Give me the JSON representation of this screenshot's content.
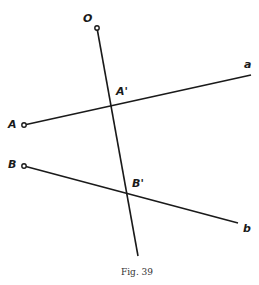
{
  "figure": {
    "caption": "Fig. 39",
    "colors": {
      "ink": "#1a1a1a",
      "background": "#ffffff"
    },
    "points": {
      "O": {
        "label": "O",
        "x": 97,
        "y": 28
      },
      "A": {
        "label": "A",
        "x": 24,
        "y": 125
      },
      "B": {
        "label": "B",
        "x": 24,
        "y": 166
      },
      "A_prime": {
        "label": "A'",
        "x": 112,
        "y": 104
      },
      "B_prime": {
        "label": "B'",
        "x": 127,
        "y": 195
      },
      "a": {
        "label": "a",
        "x": 251,
        "y": 75
      },
      "b": {
        "label": "b",
        "x": 238,
        "y": 223
      }
    },
    "lines": [
      {
        "name": "line-O",
        "from": [
          97,
          28
        ],
        "to": [
          138,
          256
        ]
      },
      {
        "name": "line-Aa",
        "from": [
          24,
          125
        ],
        "to": [
          251,
          75
        ]
      },
      {
        "name": "line-Bb",
        "from": [
          24,
          166
        ],
        "to": [
          238,
          223
        ]
      }
    ]
  }
}
